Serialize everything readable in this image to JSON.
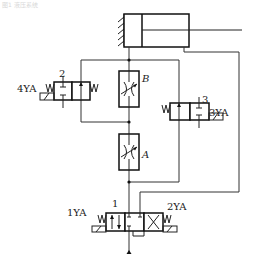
{
  "caption": "图1 液压系统",
  "cylinder": {
    "label": "hydraulic-cylinder"
  },
  "throttle_valves": [
    {
      "id": "B",
      "label": "B"
    },
    {
      "id": "A",
      "label": "A"
    }
  ],
  "directional_valves": [
    {
      "id": "1",
      "number": "1",
      "solenoids": [
        "1YA",
        "2YA"
      ]
    },
    {
      "id": "2",
      "number": "2",
      "solenoids": [
        "4YA"
      ]
    },
    {
      "id": "3",
      "number": "3",
      "solenoids": [
        "3YA"
      ]
    }
  ],
  "labels": {
    "valve1_number": "1",
    "valve1_left_solenoid": "1YA",
    "valve1_right_solenoid": "2YA",
    "valve2_number": "2",
    "valve2_solenoid": "4YA",
    "valve3_number": "3",
    "valve3_solenoid": "3YA",
    "throttle_b": "B",
    "throttle_a": "A"
  }
}
